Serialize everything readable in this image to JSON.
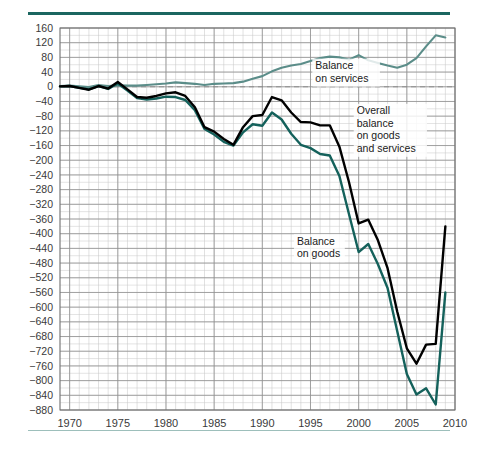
{
  "figure": {
    "background_color": "#ffffff",
    "rule_top_color": "#1b6660",
    "rule_bottom_color": "#9dbfbb"
  },
  "chart_data": {
    "type": "line",
    "title": "",
    "subtitle": "",
    "xlabel": "",
    "ylabel": "",
    "grid": true,
    "legend_position": "inline-annotations",
    "xlim": [
      1969,
      2010
    ],
    "ylim": [
      -880,
      160
    ],
    "xticks": [
      1970,
      1975,
      1980,
      1985,
      1990,
      1995,
      2000,
      2005,
      2010
    ],
    "xtick_labels": [
      "1970",
      "1975",
      "1980",
      "1985",
      "1990",
      "1995",
      "2000",
      "2005",
      "2010"
    ],
    "x_minor_step": 1,
    "yticks": [
      160,
      120,
      80,
      40,
      0,
      -40,
      -80,
      -120,
      -160,
      -200,
      -240,
      -280,
      -320,
      -360,
      -400,
      -440,
      -480,
      -520,
      -560,
      -600,
      -640,
      -680,
      -720,
      -760,
      -800,
      -840,
      -880
    ],
    "ytick_labels": [
      "160",
      "120",
      "80",
      "40",
      "0",
      "−40",
      "−80",
      "−120",
      "−160",
      "−200",
      "−240",
      "−280",
      "−320",
      "−360",
      "−400",
      "−440",
      "−480",
      "−520",
      "−560",
      "−600",
      "−640",
      "−680",
      "−720",
      "−760",
      "−800",
      "−840",
      "−880"
    ],
    "y_minor_step": 20,
    "zero_line": 0,
    "x": [
      1969,
      1970,
      1971,
      1972,
      1973,
      1974,
      1975,
      1976,
      1977,
      1978,
      1979,
      1980,
      1981,
      1982,
      1983,
      1984,
      1985,
      1986,
      1987,
      1988,
      1989,
      1990,
      1991,
      1992,
      1993,
      1994,
      1995,
      1996,
      1997,
      1998,
      1999,
      2000,
      2001,
      2002,
      2003,
      2004,
      2005,
      2006,
      2007,
      2008,
      2009
    ],
    "series": [
      {
        "name": "Balance on services",
        "color": "#5b8d89",
        "width": 2.1,
        "values": [
          2,
          3,
          1,
          -1,
          5,
          2,
          4,
          3,
          3,
          5,
          7,
          9,
          12,
          10,
          8,
          5,
          8,
          9,
          10,
          14,
          22,
          29,
          42,
          52,
          58,
          62,
          70,
          78,
          82,
          80,
          74,
          86,
          72,
          65,
          58,
          52,
          60,
          78,
          110,
          140,
          134
        ]
      },
      {
        "name": "Overall balance on goods and services",
        "color": "#000000",
        "width": 2.4,
        "values": [
          1,
          2,
          -3,
          -8,
          2,
          -5,
          13,
          -7,
          -28,
          -30,
          -25,
          -18,
          -15,
          -25,
          -56,
          -110,
          -122,
          -142,
          -158,
          -110,
          -80,
          -77,
          -28,
          -37,
          -70,
          -96,
          -97,
          -105,
          -105,
          -163,
          -260,
          -372,
          -362,
          -418,
          -494,
          -612,
          -712,
          -754,
          -702,
          -700,
          -380
        ]
      },
      {
        "name": "Balance on goods",
        "color": "#14615b",
        "width": 2.4,
        "values": [
          1,
          2,
          -3,
          -7,
          2,
          -6,
          9,
          -10,
          -31,
          -35,
          -32,
          -27,
          -28,
          -36,
          -64,
          -115,
          -130,
          -150,
          -160,
          -124,
          -102,
          -106,
          -70,
          -89,
          -128,
          -158,
          -167,
          -183,
          -187,
          -243,
          -347,
          -450,
          -428,
          -483,
          -548,
          -665,
          -782,
          -838,
          -821,
          -865,
          -560
        ]
      }
    ],
    "annotations": [
      {
        "name": "balance-on-services",
        "lines": [
          "Balance",
          "on services"
        ],
        "x": 1995.5,
        "y": 48
      },
      {
        "name": "overall-balance-on-goods-and-services",
        "lines": [
          "Overall",
          "balance",
          "on goods",
          "and services"
        ],
        "x": 1999.8,
        "y": -75
      },
      {
        "name": "balance-on-goods",
        "lines": [
          "Balance",
          "on goods"
        ],
        "x": 1993.6,
        "y": -430
      }
    ]
  }
}
